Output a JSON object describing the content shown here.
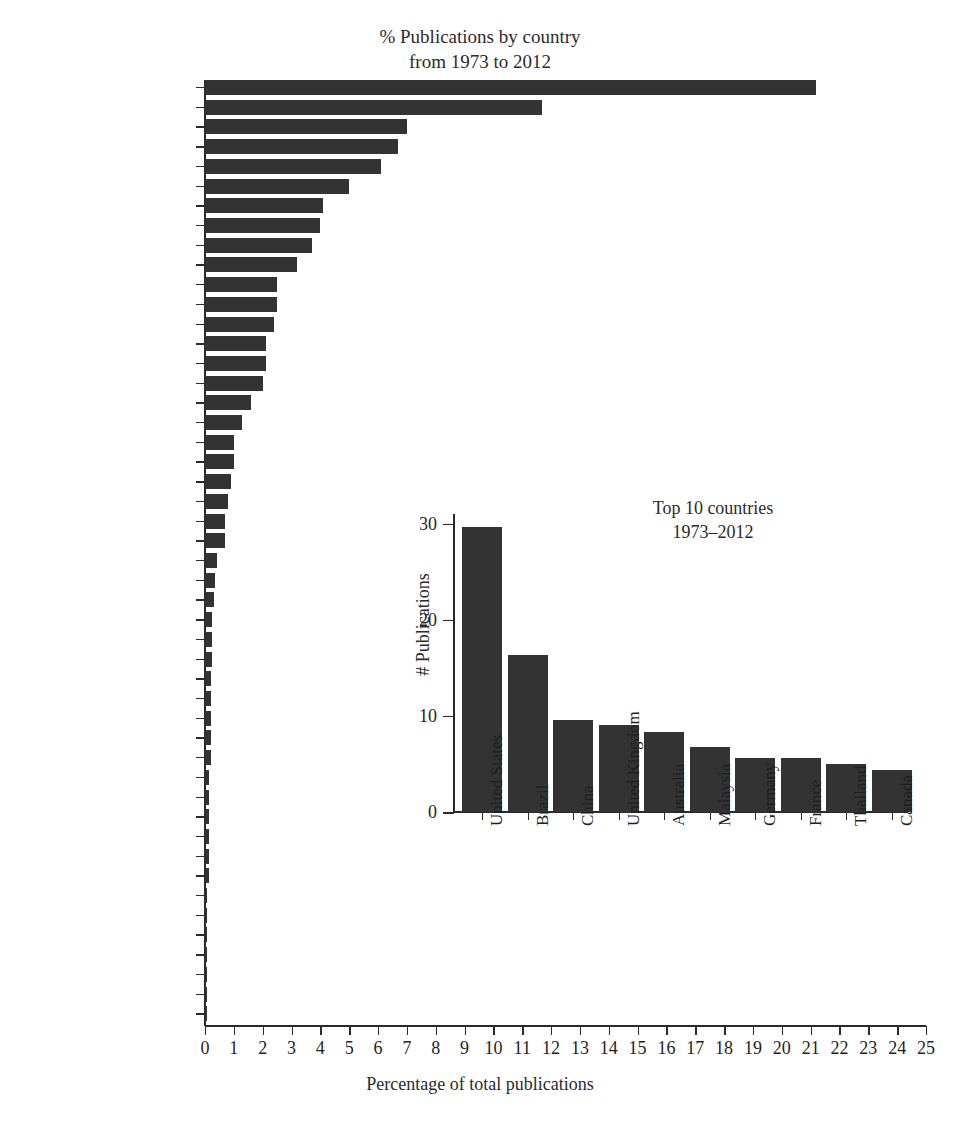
{
  "main": {
    "title_line1": "% Publications by country",
    "title_line2": "from 1973 to 2012",
    "xlabel": "Percentage of total publications"
  },
  "inset": {
    "title_line1": "Top 10 countries",
    "title_line2": "1973–2012",
    "ylabel": "# Publications"
  },
  "chart_data": [
    {
      "type": "bar",
      "orientation": "horizontal",
      "title": "% Publications by country from 1973 to 2012",
      "xlabel": "Percentage of total publications",
      "ylabel": "",
      "xlim": [
        0,
        25
      ],
      "xticks": [
        0,
        1,
        2,
        3,
        4,
        5,
        6,
        7,
        8,
        9,
        10,
        11,
        12,
        13,
        14,
        15,
        16,
        17,
        18,
        19,
        20,
        21,
        22,
        23,
        24,
        25
      ],
      "grid": false,
      "legend": "none",
      "bar_color": "#333333",
      "categories": [
        "United States",
        "Brazil",
        "China",
        "United Kingdom",
        "Australia",
        "Malaysia",
        "Germany",
        "France",
        "Thailand",
        "Canada",
        "South Africa",
        "Italy",
        "Belgium",
        "Spain",
        "India",
        "Colombia",
        "Argentina",
        "Poland",
        "Taiwan",
        "Portugal",
        "Turkey",
        "Egypt",
        "Japan",
        "Austria",
        "Russia",
        "New Zealand",
        "Finland",
        "Pakistan",
        "Netherlands",
        "Korean Republic",
        "Venezuela",
        "Switzerland",
        "Panama",
        "Norway",
        "Mexico",
        "Kuwait",
        "Czech Republic",
        "Croatia",
        "Costa Rica",
        "Chile",
        "Cameroon",
        "Serbia",
        "Scotland",
        "Romania",
        "Peru",
        "Israel",
        "Iran",
        "Greece"
      ],
      "values": [
        21.2,
        11.7,
        7.0,
        6.7,
        6.1,
        5.0,
        4.1,
        4.0,
        3.7,
        3.2,
        2.5,
        2.5,
        2.4,
        2.1,
        2.1,
        2.0,
        1.6,
        1.3,
        1.0,
        1.0,
        0.9,
        0.8,
        0.7,
        0.7,
        0.4,
        0.35,
        0.3,
        0.25,
        0.25,
        0.25,
        0.2,
        0.2,
        0.2,
        0.2,
        0.2,
        0.15,
        0.15,
        0.15,
        0.15,
        0.15,
        0.15,
        0.08,
        0.08,
        0.08,
        0.08,
        0.08,
        0.08,
        0.08
      ]
    },
    {
      "type": "bar",
      "orientation": "vertical",
      "title": "Top 10 countries 1973–2012",
      "xlabel": "",
      "ylabel": "# Publications",
      "ylim": [
        0,
        31
      ],
      "yticks": [
        0,
        10,
        20,
        30
      ],
      "grid": false,
      "legend": "none",
      "bar_color": "#333333",
      "categories": [
        "United States",
        "Brazil",
        "China",
        "United Kingdom",
        "Australia",
        "Malaysia",
        "Germany",
        "France",
        "Thailand",
        "Canada"
      ],
      "values": [
        29.7,
        16.3,
        9.6,
        9.1,
        8.3,
        6.8,
        5.6,
        5.6,
        5.0,
        4.4
      ]
    }
  ]
}
